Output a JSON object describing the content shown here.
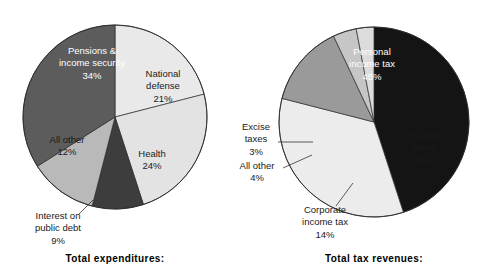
{
  "page": {
    "background": "#ffffff",
    "width": 483,
    "height": 269
  },
  "charts": [
    {
      "id": "total-expenditures",
      "title": "Total expenditures:",
      "center": {
        "x": 115,
        "y": 117
      },
      "radius": 92,
      "start_angle_deg": 0,
      "labels": [
        {
          "name": "national-defense",
          "lines": [
            "National",
            "defense",
            "21%"
          ],
          "x": 163,
          "y": 86,
          "on_dark": false
        },
        {
          "name": "health",
          "lines": [
            "Health",
            "24%"
          ],
          "x": 152,
          "y": 160,
          "on_dark": false
        },
        {
          "name": "interest-on-public-debt",
          "lines": [
            "Interest on",
            "public debt",
            "9%"
          ],
          "x": 58,
          "y": 228,
          "on_dark": false,
          "leader": {
            "x1": 78,
            "y1": 215,
            "x2": 93,
            "y2": 200
          }
        },
        {
          "name": "all-other",
          "lines": [
            "All other",
            "12%"
          ],
          "x": 67,
          "y": 146,
          "on_dark": false
        },
        {
          "name": "pensions-income-security",
          "lines": [
            "Pensions &",
            "income security",
            "34%"
          ],
          "x": 92,
          "y": 63,
          "on_dark": true
        }
      ]
    },
    {
      "id": "total-tax-revenues",
      "title": "Total tax revenues:",
      "center": {
        "x": 374,
        "y": 122
      },
      "radius": 95,
      "start_angle_deg": 0,
      "labels": [
        {
          "name": "personal-income-tax",
          "lines": [
            "Personal",
            "income tax",
            "45%"
          ],
          "x": 372,
          "y": 64,
          "on_dark": true
        },
        {
          "name": "payroll-taxes",
          "lines": [
            "Payroll",
            "taxes",
            "34%"
          ],
          "x": 424,
          "y": 148,
          "on_dark": false
        },
        {
          "name": "corporate-income-tax",
          "lines": [
            "Corporate",
            "income tax",
            "14%"
          ],
          "x": 325,
          "y": 222,
          "on_dark": false,
          "leader": {
            "x1": 336,
            "y1": 206,
            "x2": 353,
            "y2": 183
          }
        },
        {
          "name": "all-other",
          "lines": [
            "All other",
            "4%"
          ],
          "x": 257,
          "y": 172,
          "on_dark": false,
          "leader": {
            "x1": 283,
            "y1": 168,
            "x2": 312,
            "y2": 155
          }
        },
        {
          "name": "excise-taxes",
          "lines": [
            "Excise",
            "taxes",
            "3%"
          ],
          "x": 256,
          "y": 139,
          "on_dark": false,
          "leader": {
            "x1": 278,
            "y1": 142,
            "x2": 313,
            "y2": 142
          }
        }
      ]
    }
  ],
  "chart_data": [
    {
      "type": "pie",
      "title": "Total expenditures:",
      "categories": [
        "National defense",
        "Health",
        "Interest on public debt",
        "All other",
        "Pensions & income security"
      ],
      "values": [
        21,
        24,
        9,
        12,
        34
      ],
      "value_labels": [
        "21%",
        "24%",
        "9%",
        "12%",
        "34%"
      ],
      "units": "percent",
      "colors": [
        "#e9e9e9",
        "#e3e3e3",
        "#3d3d3d",
        "#b9b9b9",
        "#5c5c5c"
      ],
      "legend": "none",
      "direction": "clockwise",
      "start_at": "12 o'clock"
    },
    {
      "type": "pie",
      "title": "Total tax revenues:",
      "categories": [
        "Personal income tax",
        "Payroll taxes",
        "Corporate income tax",
        "All other",
        "Excise taxes"
      ],
      "values": [
        45,
        34,
        14,
        4,
        3
      ],
      "value_labels": [
        "45%",
        "34%",
        "14%",
        "4%",
        "3%"
      ],
      "units": "percent",
      "colors": [
        "#141414",
        "#ececec",
        "#9a9a9a",
        "#c6c6c6",
        "#dcdcdc"
      ],
      "legend": "none",
      "direction": "clockwise",
      "start_at": "12 o'clock"
    }
  ]
}
